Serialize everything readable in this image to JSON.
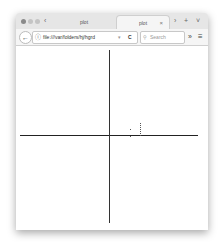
{
  "browser": {
    "tabs": [
      {
        "label": "plot",
        "active": false
      },
      {
        "label": "plot",
        "active": true
      }
    ],
    "tab_close": "×",
    "tab_controls": {
      "scroll_left": "‹",
      "scroll_right": "›",
      "new_tab": "+",
      "menu": "˅"
    },
    "url": "file:///var/folders/hj/hgrd",
    "url_dropdown": "▾",
    "reload": "C",
    "search_placeholder": "Search",
    "search_icon": "🔍",
    "back_icon": "←",
    "info_icon": "ⓘ",
    "overflow_icon": "»",
    "menu_icon": "≡",
    "window_dots": [
      "#bdbdbd",
      "#cfcfcf",
      "#cfcfcf"
    ]
  },
  "plot": {
    "axis_color": "#222222",
    "points": [
      {
        "x": 21,
        "y": -6
      },
      {
        "x": 21,
        "y": 1
      },
      {
        "x": 31,
        "y": -12
      },
      {
        "x": 31,
        "y": -10
      },
      {
        "x": 31,
        "y": -8
      },
      {
        "x": 31,
        "y": -6
      },
      {
        "x": 31,
        "y": -4
      },
      {
        "x": 31,
        "y": -2
      },
      {
        "x": 31,
        "y": 0
      }
    ]
  }
}
